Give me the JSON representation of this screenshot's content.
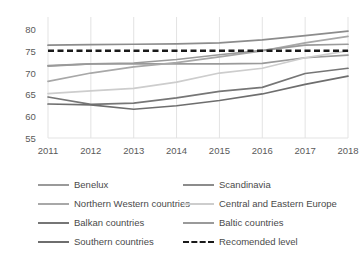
{
  "chart_data": {
    "type": "line",
    "title": "",
    "subtitle": "",
    "xlabel": "",
    "ylabel": "",
    "x": [
      2011,
      2012,
      2013,
      2014,
      2015,
      2016,
      2017,
      2018
    ],
    "xtick_labels": [
      "2011",
      "2012",
      "2013",
      "2014",
      "2015",
      "2016",
      "2017",
      "2018"
    ],
    "ytick_labels": [
      "55",
      "60",
      "65",
      "70",
      "75",
      "80"
    ],
    "yticks": [
      55,
      60,
      65,
      70,
      75,
      80
    ],
    "ylim": [
      55,
      80
    ],
    "xlim": [
      2011,
      2018
    ],
    "grid": true,
    "grid_axis": "x",
    "legend_position": "below",
    "legend_columns": 2,
    "series": [
      {
        "name": "Benelux",
        "color": "#9a9a9a",
        "style": "solid",
        "values": [
          71.5,
          72.0,
          72.0,
          72.0,
          72.0,
          72.1,
          73.4,
          74.0
        ]
      },
      {
        "name": "Scandinavia",
        "color": "#8c8c8c",
        "style": "solid",
        "values": [
          76.3,
          76.4,
          76.5,
          76.6,
          76.8,
          77.5,
          78.5,
          79.5
        ]
      },
      {
        "name": "Northern Western countries",
        "color": "#a8a8a8",
        "style": "solid",
        "values": [
          68.0,
          69.9,
          71.3,
          72.3,
          73.6,
          75.0,
          76.8,
          78.3
        ]
      },
      {
        "name": "Central and Eastern Europe",
        "color": "#cdcdcd",
        "style": "solid",
        "values": [
          65.2,
          65.8,
          66.4,
          67.8,
          69.9,
          71.0,
          73.4,
          75.0
        ]
      },
      {
        "name": "Balkan countries",
        "color": "#767676",
        "style": "solid",
        "values": [
          64.4,
          62.7,
          63.0,
          64.2,
          65.7,
          66.6,
          69.8,
          71.0
        ]
      },
      {
        "name": "Baltic countries",
        "color": "#9a9a9a",
        "style": "solid",
        "values": [
          71.6,
          72.0,
          72.2,
          73.0,
          74.1,
          75.1,
          76.3,
          76.5
        ]
      },
      {
        "name": "Southern countries",
        "color": "#6e6e6e",
        "style": "solid",
        "values": [
          62.8,
          62.6,
          61.6,
          62.4,
          63.6,
          65.1,
          67.3,
          69.2
        ]
      },
      {
        "name": "Recomended level",
        "color": "#1a1a1a",
        "style": "dashed",
        "values": [
          75,
          75,
          75,
          75,
          75,
          75,
          75,
          75
        ]
      }
    ]
  },
  "legend": {
    "items": [
      {
        "label": "Benelux",
        "color": "#9a9a9a",
        "style": "solid",
        "col": 0,
        "row": 0
      },
      {
        "label": "Scandinavia",
        "color": "#8c8c8c",
        "style": "solid",
        "col": 1,
        "row": 0
      },
      {
        "label": "Northern Western countries",
        "color": "#a8a8a8",
        "style": "solid",
        "col": 0,
        "row": 1
      },
      {
        "label": "Central and Eastern Europe",
        "color": "#cdcdcd",
        "style": "solid",
        "col": 1,
        "row": 1
      },
      {
        "label": "Balkan countries",
        "color": "#767676",
        "style": "solid",
        "col": 0,
        "row": 2
      },
      {
        "label": "Baltic countries",
        "color": "#9a9a9a",
        "style": "solid",
        "col": 1,
        "row": 2
      },
      {
        "label": "Southern countries",
        "color": "#6e6e6e",
        "style": "solid",
        "col": 0,
        "row": 3
      },
      {
        "label": "Recomended level",
        "color": "#1a1a1a",
        "style": "dashed",
        "col": 1,
        "row": 3
      }
    ]
  },
  "style": {
    "background": "#ffffff",
    "gridline_color": "#e3e3e3",
    "tick_label_color": "#5a5a5a"
  }
}
